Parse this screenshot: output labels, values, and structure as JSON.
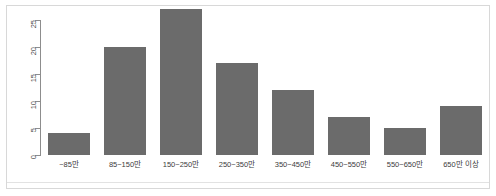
{
  "chart_data": {
    "type": "bar",
    "title": "",
    "subtitle": "",
    "xlabel": "",
    "ylabel": "",
    "categories": [
      "~85만",
      "85~150만",
      "150~250만",
      "250~350만",
      "350~450만",
      "450~550만",
      "550~650만",
      "650만 이상"
    ],
    "values": [
      4,
      20,
      27,
      17,
      12,
      7,
      5,
      9
    ],
    "ylim": [
      0,
      27.8
    ],
    "yticks": [
      0,
      5,
      10,
      15,
      20,
      25
    ],
    "ytick_labels": [
      "0",
      "5",
      "10",
      "15",
      "20",
      "25"
    ],
    "grid": false,
    "legend": false,
    "legend_position": "none",
    "bar_color": "#6b6b6b",
    "axis_color": "#8d8d8d",
    "frame_color": "#d8d8d8",
    "background": "#ffffff"
  }
}
